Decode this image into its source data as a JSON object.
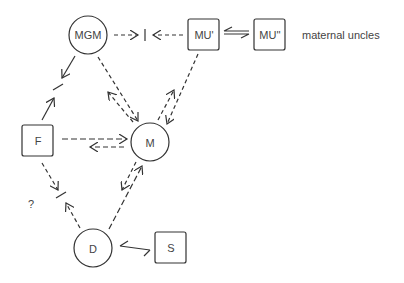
{
  "diagram": {
    "nodes": [
      {
        "id": "MGM",
        "label": "MGM",
        "shape": "circle"
      },
      {
        "id": "MU1",
        "label": "MU'",
        "shape": "square"
      },
      {
        "id": "MU2",
        "label": "MU''",
        "shape": "square"
      },
      {
        "id": "F",
        "label": "F",
        "shape": "square"
      },
      {
        "id": "M",
        "label": "M",
        "shape": "circle"
      },
      {
        "id": "D",
        "label": "D",
        "shape": "circle"
      },
      {
        "id": "S",
        "label": "S",
        "shape": "square"
      }
    ],
    "annotations": {
      "maternal_uncles": "maternal uncles",
      "question": "?"
    },
    "edges": [
      {
        "from": "MGM",
        "to": "MU1",
        "style": "dashed",
        "note": "blocked midway"
      },
      {
        "from": "MU1",
        "to": "MGM",
        "style": "dashed",
        "note": "blocked midway"
      },
      {
        "from": "MU1",
        "to": "MU2",
        "style": "solid",
        "bidirectional": true
      },
      {
        "from": "MGM",
        "to": "F",
        "style": "solid",
        "note": "blocked midway"
      },
      {
        "from": "F",
        "to": "MGM",
        "style": "solid",
        "note": "blocked midway"
      },
      {
        "from": "MGM",
        "to": "M",
        "style": "dashed"
      },
      {
        "from": "M",
        "to": "MGM",
        "style": "dashed"
      },
      {
        "from": "MU1",
        "to": "M",
        "style": "dashed"
      },
      {
        "from": "M",
        "to": "MU1",
        "style": "dashed"
      },
      {
        "from": "F",
        "to": "M",
        "style": "dashed"
      },
      {
        "from": "M",
        "to": "F",
        "style": "dashed"
      },
      {
        "from": "F",
        "to": "D",
        "style": "dashed",
        "note": "blocked midway"
      },
      {
        "from": "D",
        "to": "F",
        "style": "dashed",
        "note": "blocked midway"
      },
      {
        "from": "M",
        "to": "D",
        "style": "dashed"
      },
      {
        "from": "D",
        "to": "M",
        "style": "dashed"
      },
      {
        "from": "S",
        "to": "D",
        "style": "solid"
      }
    ]
  }
}
